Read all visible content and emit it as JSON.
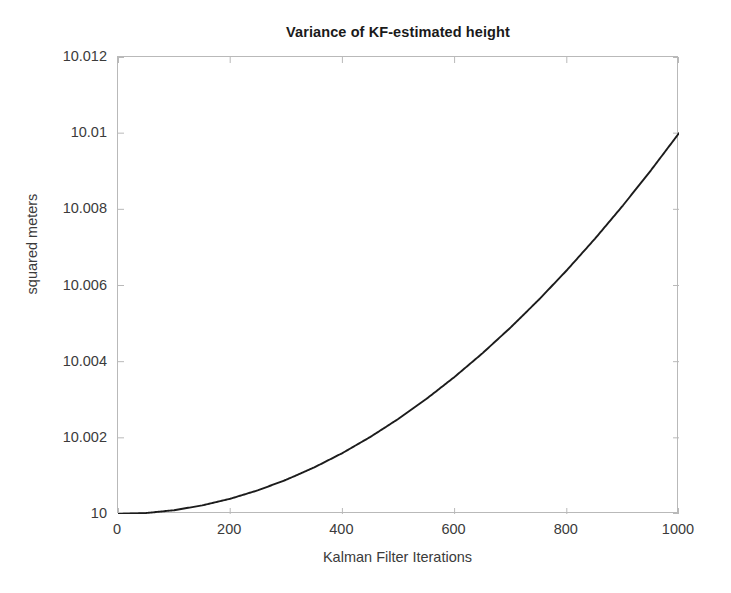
{
  "chart_data": {
    "type": "line",
    "title": "Variance of KF-estimated height",
    "xlabel": "Kalman Filter Iterations",
    "ylabel": "squared meters",
    "xlim": [
      0,
      1000
    ],
    "ylim": [
      10,
      10.012
    ],
    "grid": false,
    "legend": null,
    "line_color": "#1c1c1c",
    "xticks": [
      0,
      200,
      400,
      600,
      800,
      1000
    ],
    "xtick_labels": [
      "0",
      "200",
      "400",
      "600",
      "800",
      "1000"
    ],
    "yticks": [
      10,
      10.002,
      10.004,
      10.006,
      10.008,
      10.01,
      10.012
    ],
    "ytick_labels": [
      "10",
      "10.002",
      "10.004",
      "10.006",
      "10.008",
      "10.01",
      "10.012"
    ],
    "series": [
      {
        "name": "variance",
        "x": [
          0,
          50,
          100,
          150,
          200,
          250,
          300,
          350,
          400,
          450,
          500,
          550,
          600,
          650,
          700,
          750,
          800,
          850,
          900,
          950,
          1000
        ],
        "y": [
          10.0,
          10.000025,
          10.0001,
          10.000225,
          10.0004,
          10.000625,
          10.0009,
          10.001225,
          10.0016,
          10.002025,
          10.0025,
          10.003025,
          10.0036,
          10.004225,
          10.0049,
          10.005625,
          10.0064,
          10.007225,
          10.0081,
          10.009025,
          10.01
        ]
      }
    ],
    "annotations": []
  },
  "figure": {
    "background_color": "#ffffff",
    "axes_border_color": "#b9b9b9",
    "tick_label_color": "#3b3b3b",
    "title_color": "#1a1a1a"
  }
}
